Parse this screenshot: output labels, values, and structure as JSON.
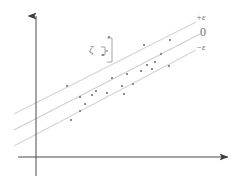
{
  "figure": {
    "background_color": "#ffffff"
  },
  "axes": {
    "x_axis": {
      "name": "horizontal-axis",
      "color": "#4a4a4a",
      "y": 157,
      "x_start": 18,
      "x_end": 233,
      "arrow": "right"
    },
    "y_axis": {
      "name": "vertical-axis",
      "color": "#4a4a4a",
      "x": 36,
      "y_start": 12,
      "y_end": 178,
      "arrow": "up"
    }
  },
  "labels": {
    "plus_epsilon": "+ε",
    "zero": "0",
    "minus_epsilon": "−ε",
    "zeta": "ζ"
  },
  "colors": {
    "axis": "#4a4a4a",
    "tube_line": "#d2d2d2",
    "center_line": "#cfcfcf",
    "point": "#8c8c8c",
    "label": "#6e6e6e",
    "brace": "#9a9a9a"
  },
  "chart_data": {
    "type": "scatter",
    "title": "",
    "xlabel": "",
    "ylabel": "",
    "grid": false,
    "legend": [
      "+ε",
      "0",
      "−ε"
    ],
    "legend_position": "right-inline",
    "lines": [
      {
        "name": "+epsilon",
        "label": "+ε",
        "x1": 14,
        "y1": 114,
        "x2": 196,
        "y2": 22
      },
      {
        "name": "regression",
        "label": "0",
        "x1": 14,
        "y1": 130,
        "x2": 200,
        "y2": 34
      },
      {
        "name": "-epsilon",
        "label": "−ε",
        "x1": 14,
        "y1": 146,
        "x2": 196,
        "y2": 50
      }
    ],
    "points": [
      {
        "x": 67,
        "y": 86
      },
      {
        "x": 80,
        "y": 97
      },
      {
        "x": 92,
        "y": 95
      },
      {
        "x": 85,
        "y": 104
      },
      {
        "x": 80,
        "y": 111
      },
      {
        "x": 96,
        "y": 91
      },
      {
        "x": 107,
        "y": 93
      },
      {
        "x": 122,
        "y": 86
      },
      {
        "x": 124,
        "y": 94
      },
      {
        "x": 112,
        "y": 78
      },
      {
        "x": 127,
        "y": 74
      },
      {
        "x": 133,
        "y": 84
      },
      {
        "x": 141,
        "y": 71
      },
      {
        "x": 147,
        "y": 65
      },
      {
        "x": 152,
        "y": 69
      },
      {
        "x": 155,
        "y": 62
      },
      {
        "x": 161,
        "y": 54
      },
      {
        "x": 169,
        "y": 66
      },
      {
        "x": 103,
        "y": 55
      },
      {
        "x": 109,
        "y": 37
      },
      {
        "x": 144,
        "y": 45
      },
      {
        "x": 170,
        "y": 40
      },
      {
        "x": 71,
        "y": 120
      }
    ],
    "annotation": {
      "symbol": "ζ",
      "x": 89,
      "y": 44,
      "brace_x": 107,
      "brace_top": 37,
      "brace_bottom": 61
    }
  }
}
